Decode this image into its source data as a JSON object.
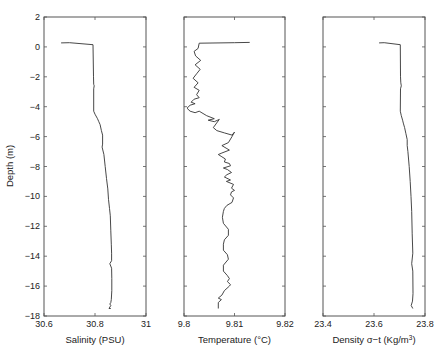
{
  "chart_data": [
    {
      "type": "line",
      "id": "salinity",
      "xlabel": "Salinity (PSU)",
      "ylabel": "Depth (m)",
      "xlim": [
        30.6,
        31
      ],
      "ylim": [
        -18,
        2
      ],
      "xticks": [
        30.6,
        30.8,
        31
      ],
      "xtick_labels": [
        "30.6",
        "30.8",
        "31"
      ],
      "yticks": [
        2,
        0,
        -2,
        -4,
        -6,
        -8,
        -10,
        -12,
        -14,
        -16,
        -18
      ],
      "ytick_labels": [
        "2",
        "0",
        "-2",
        "-4",
        "-6",
        "-8",
        "-10",
        "-12",
        "-14",
        "-16",
        "-18"
      ],
      "grid": false,
      "series": [
        {
          "name": "Salinity profile",
          "x": [
            30.667,
            30.7,
            30.792,
            30.794,
            30.795,
            30.797,
            30.795,
            30.795,
            30.8,
            30.81,
            30.815,
            30.82,
            30.825,
            30.83,
            30.83,
            30.828,
            30.835,
            30.84,
            30.845,
            30.85,
            30.853,
            30.857,
            30.86,
            30.862,
            30.864,
            30.865,
            30.865,
            30.858,
            30.865,
            30.866,
            30.866,
            30.864,
            30.862,
            30.858,
            30.862,
            30.855,
            30.862
          ],
          "y": [
            0.27,
            0.28,
            0.15,
            -2.0,
            -2.5,
            -2.6,
            -2.8,
            -4.3,
            -4.5,
            -4.8,
            -5.0,
            -5.2,
            -5.6,
            -5.9,
            -6.5,
            -6.7,
            -7.2,
            -8.0,
            -8.8,
            -9.5,
            -10.2,
            -10.8,
            -11.3,
            -12.3,
            -13.2,
            -13.8,
            -14.3,
            -14.5,
            -14.8,
            -15.5,
            -16.3,
            -16.9,
            -17.1,
            -17.2,
            -17.3,
            -17.5,
            -17.5
          ]
        }
      ]
    },
    {
      "type": "line",
      "id": "temperature",
      "xlabel": "Temperature (°C)",
      "ylabel": "",
      "xlim": [
        9.8,
        9.82
      ],
      "ylim": [
        -18,
        2
      ],
      "xticks": [
        9.8,
        9.81,
        9.82
      ],
      "xtick_labels": [
        "9.8",
        "9.81",
        "9.82"
      ],
      "grid": false,
      "series": [
        {
          "name": "Temperature profile",
          "x": [
            9.813,
            9.81,
            9.803,
            9.8028,
            9.802,
            9.8023,
            9.8033,
            9.8022,
            9.8032,
            9.8025,
            9.8018,
            9.8028,
            9.802,
            9.803,
            9.8025,
            9.803,
            9.802,
            9.8014,
            9.8022,
            9.8012,
            9.8006,
            9.8012,
            9.8022,
            9.803,
            9.8045,
            9.806,
            9.8048,
            9.806,
            9.807,
            9.8058,
            9.8065,
            9.808,
            9.8095,
            9.81,
            9.8095,
            9.8088,
            9.8075,
            9.8085,
            9.809,
            9.8075,
            9.8068,
            9.8075,
            9.8082,
            9.808,
            9.809,
            9.8092,
            9.8078,
            9.8086,
            9.8094,
            9.8085,
            9.808,
            9.8092,
            9.8084,
            9.8098,
            9.8094,
            9.81,
            9.8094,
            9.8092,
            9.8098,
            9.8095,
            9.8085,
            9.808,
            9.8078,
            9.8076,
            9.8078,
            9.8088,
            9.8088,
            9.808,
            9.8078,
            9.8078,
            9.8086,
            9.8088,
            9.8078,
            9.8078,
            9.8086,
            9.809,
            9.8086,
            9.8092,
            9.809,
            9.808,
            9.8075,
            9.8068,
            9.8074,
            9.8068,
            9.8068
          ],
          "y": [
            0.3,
            0.28,
            0.25,
            -0.1,
            -0.3,
            -0.6,
            -0.9,
            -1.2,
            -1.5,
            -1.8,
            -2.1,
            -2.4,
            -2.7,
            -2.9,
            -3.2,
            -3.4,
            -3.5,
            -3.7,
            -3.8,
            -3.9,
            -4.1,
            -4.3,
            -4.4,
            -4.3,
            -4.6,
            -4.8,
            -4.9,
            -5.0,
            -4.85,
            -5.4,
            -5.6,
            -5.75,
            -5.9,
            -5.7,
            -6.0,
            -6.4,
            -6.6,
            -6.8,
            -6.9,
            -7.1,
            -7.2,
            -7.35,
            -7.5,
            -7.7,
            -7.8,
            -7.95,
            -8.1,
            -8.2,
            -8.4,
            -8.55,
            -8.7,
            -8.9,
            -9.0,
            -9.2,
            -9.45,
            -9.6,
            -9.7,
            -9.9,
            -10.1,
            -10.4,
            -10.6,
            -10.8,
            -11.0,
            -11.4,
            -11.8,
            -12.2,
            -12.6,
            -12.9,
            -13.2,
            -13.6,
            -13.9,
            -14.2,
            -14.6,
            -15.0,
            -15.3,
            -15.5,
            -15.7,
            -15.9,
            -16.0,
            -16.3,
            -16.6,
            -16.8,
            -16.9,
            -17.1,
            -17.5
          ]
        }
      ]
    },
    {
      "type": "line",
      "id": "density",
      "xlabel": "Density σ−t (Kg/m³)",
      "xlabel_main": "Density σ−t (Kg/m",
      "xlabel_sup": "3",
      "xlabel_end": ")",
      "ylabel": "",
      "xlim": [
        23.4,
        23.8
      ],
      "ylim": [
        -18,
        2
      ],
      "xticks": [
        23.4,
        23.6,
        23.8
      ],
      "xtick_labels": [
        "23.4",
        "23.6",
        "23.8"
      ],
      "grid": false,
      "series": [
        {
          "name": "Density profile",
          "x": [
            23.62,
            23.64,
            23.703,
            23.704,
            23.705,
            23.707,
            23.704,
            23.703,
            23.707,
            23.712,
            23.715,
            23.72,
            23.725,
            23.73,
            23.73,
            23.733,
            23.738,
            23.742,
            23.745,
            23.748,
            23.75,
            23.752,
            23.748,
            23.752,
            23.753,
            23.751,
            23.746,
            23.752
          ],
          "y": [
            0.27,
            0.28,
            0.15,
            -2.0,
            -2.4,
            -2.6,
            -2.8,
            -4.3,
            -4.6,
            -4.9,
            -5.1,
            -5.4,
            -5.8,
            -6.2,
            -6.6,
            -7.0,
            -8.0,
            -9.0,
            -10.0,
            -11.0,
            -12.5,
            -13.8,
            -14.5,
            -15.0,
            -16.5,
            -17.0,
            -17.3,
            -17.5
          ]
        }
      ]
    }
  ]
}
